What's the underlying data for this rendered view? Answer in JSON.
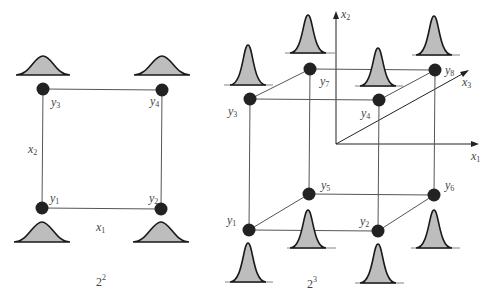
{
  "figure": {
    "left_panel": {
      "caption_base": "2",
      "caption_exp": "2",
      "axis_labels": {
        "x1": {
          "var": "x",
          "sub": "1"
        },
        "x2": {
          "var": "x",
          "sub": "2"
        }
      },
      "nodes": [
        {
          "id": "y1",
          "var": "y",
          "sub": "1"
        },
        {
          "id": "y2",
          "var": "y",
          "sub": "2"
        },
        {
          "id": "y3",
          "var": "y",
          "sub": "3"
        },
        {
          "id": "y4",
          "var": "y",
          "sub": "4"
        }
      ]
    },
    "right_panel": {
      "caption_base": "2",
      "caption_exp": "3",
      "axis_labels": {
        "x1": {
          "var": "x",
          "sub": "1"
        },
        "x2": {
          "var": "x",
          "sub": "2"
        },
        "x3": {
          "var": "x",
          "sub": "3"
        }
      },
      "nodes": [
        {
          "id": "y1",
          "var": "y",
          "sub": "1"
        },
        {
          "id": "y2",
          "var": "y",
          "sub": "2"
        },
        {
          "id": "y3",
          "var": "y",
          "sub": "3"
        },
        {
          "id": "y4",
          "var": "y",
          "sub": "4"
        },
        {
          "id": "y5",
          "var": "y",
          "sub": "5"
        },
        {
          "id": "y6",
          "var": "y",
          "sub": "6"
        },
        {
          "id": "y7",
          "var": "y",
          "sub": "7"
        },
        {
          "id": "y8",
          "var": "y",
          "sub": "8"
        }
      ]
    },
    "colors": {
      "node": "#222222",
      "distribution_fill": "#bdbdbd",
      "distribution_stroke": "#1a1a1a",
      "edge": "#555555"
    }
  }
}
